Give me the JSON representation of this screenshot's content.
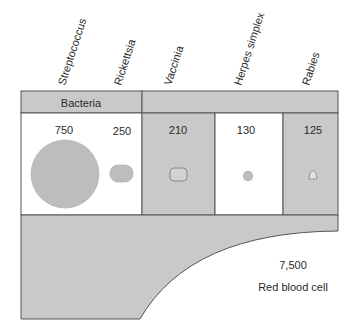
{
  "organisms": [
    {
      "name": "Streptococcus",
      "size": "750",
      "group": "Bacteria",
      "shape": "large-circle"
    },
    {
      "name": "Rickettsia",
      "size": "250",
      "group": "Bacteria",
      "shape": "rounded-oval"
    },
    {
      "name": "Vaccinia",
      "size": "210",
      "group": "Virus",
      "shape": "rounded-rectangle"
    },
    {
      "name": "Herpes simplex",
      "size": "130",
      "group": "Virus",
      "shape": "small-circle"
    },
    {
      "name": "Rabies",
      "size": "125",
      "group": "Virus",
      "shape": "bullet"
    }
  ],
  "header": {
    "bacteria_label": "Bacteria",
    "virus_label": ""
  },
  "red_blood_cell": {
    "size": "7,500",
    "label": "Red blood cell"
  },
  "colors": {
    "gray_fill": "#c9c9c9",
    "white_fill": "#ffffff",
    "border": "#555555",
    "shape_fill": "#bdbdbd"
  }
}
